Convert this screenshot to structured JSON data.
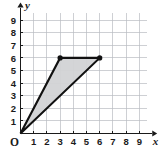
{
  "chart_data": {
    "type": "scatter",
    "title": "",
    "subtitle": "",
    "xlabel": "x",
    "ylabel": "y",
    "origin_label": "O",
    "xlim": [
      0,
      9.6
    ],
    "ylim": [
      0,
      9.6
    ],
    "grid": true,
    "legend": null,
    "x_ticks": [
      1,
      2,
      3,
      4,
      5,
      6,
      7,
      8,
      9
    ],
    "y_ticks": [
      1,
      2,
      3,
      4,
      5,
      6,
      7,
      8,
      9
    ],
    "x_tick_labels": [
      "1",
      "2",
      "3",
      "4",
      "5",
      "6",
      "7",
      "8",
      "9"
    ],
    "y_tick_labels": [
      "1",
      "2",
      "3",
      "4",
      "5",
      "6",
      "7",
      "8",
      "9"
    ],
    "series": [
      {
        "name": "triangle",
        "shape": "polygon",
        "closed": true,
        "fill_color": "#d2d3d5",
        "edge_color": "#111111",
        "points": [
          {
            "x": 0,
            "y": 0,
            "marker": false
          },
          {
            "x": 3,
            "y": 6,
            "marker": true
          },
          {
            "x": 6,
            "y": 6,
            "marker": true
          }
        ]
      }
    ]
  },
  "colors": {
    "background": "#ffffff",
    "grid": "#b9bcc2",
    "axis": "#1a1a1a",
    "shape_fill": "#d2d3d5",
    "shape_edge": "#111111"
  }
}
